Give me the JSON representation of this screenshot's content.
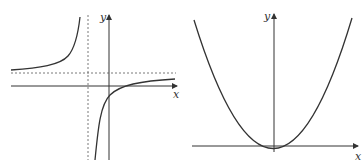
{
  "figures": [
    {
      "id": "left",
      "description": "Rectangular hyperbola with vertical and horizontal asymptotes",
      "x_axis_label": "x",
      "y_axis_label": "y",
      "asymptotes": {
        "vertical": "dotted line left of y-axis",
        "horizontal": "dotted line above x-axis"
      }
    },
    {
      "id": "right",
      "description": "Upward-opening parabola with vertex slightly below the x-axis, near the origin",
      "x_axis_label": "x",
      "y_axis_label": "y"
    }
  ],
  "colors": {
    "line": "#333333",
    "dotted": "#555555",
    "background": "#ffffff"
  }
}
